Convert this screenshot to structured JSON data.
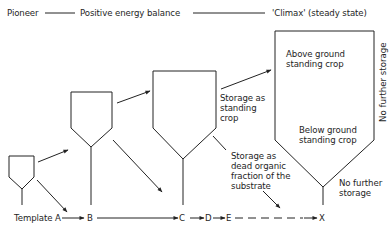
{
  "header": {
    "pioneer": "Pioneer",
    "positive_energy_balance": "Positive energy balance",
    "climax": "'Climax' (steady state)"
  },
  "labels": {
    "above_ground_line1": "Above ground",
    "above_ground_line2": "standing crop",
    "below_ground_line1": "Below ground",
    "below_ground_line2": "standing crop",
    "no_further_storage_vertical": "No further storage",
    "no_further_storage_line1": "No further",
    "no_further_storage_line2": "storage",
    "storage_standing_line1": "Storage as",
    "storage_standing_line2": "standing",
    "storage_standing_line3": "crop",
    "storage_dead_line1": "Storage as",
    "storage_dead_line2": "dead organic",
    "storage_dead_line3": "fraction of the",
    "storage_dead_line4": "substrate"
  },
  "sequence": {
    "template_a": "Template A",
    "b": "B",
    "c": "C",
    "d": "D",
    "e": "E",
    "x": "X"
  },
  "colors": {
    "line": "#222222",
    "background": "#ffffff"
  }
}
